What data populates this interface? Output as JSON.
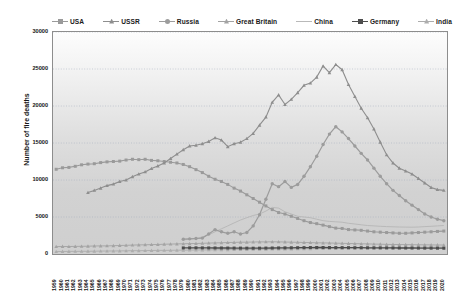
{
  "chart_data": {
    "type": "line",
    "title": "",
    "xlabel": "",
    "ylabel": "Number of fire deaths",
    "ylim": [
      0,
      30000
    ],
    "ytick_labels": [
      "0",
      "5000",
      "10000",
      "15000",
      "20000",
      "25000",
      "30000"
    ],
    "ytick_values": [
      0,
      5000,
      10000,
      15000,
      20000,
      25000,
      30000
    ],
    "grid": true,
    "legend_position": "top",
    "x": [
      1959,
      1960,
      1961,
      1962,
      1963,
      1964,
      1965,
      1966,
      1967,
      1968,
      1969,
      1970,
      1971,
      1972,
      1973,
      1974,
      1975,
      1976,
      1977,
      1978,
      1979,
      1980,
      1981,
      1982,
      1983,
      1984,
      1985,
      1986,
      1987,
      1988,
      1989,
      1990,
      1991,
      1992,
      1993,
      1994,
      1995,
      1996,
      1997,
      1998,
      1999,
      2000,
      2001,
      2002,
      2003,
      2004,
      2005,
      2006,
      2007,
      2008,
      2009,
      2010,
      2011,
      2012,
      2013,
      2014,
      2015,
      2016,
      2017,
      2018,
      2019,
      2020
    ],
    "series": [
      {
        "name": "USA",
        "color": "#9a9a9a",
        "marker": "square",
        "values": [
          11450,
          11650,
          11700,
          11850,
          12050,
          12150,
          12200,
          12350,
          12450,
          12500,
          12550,
          12700,
          12800,
          12750,
          12800,
          12650,
          12600,
          12500,
          12400,
          12300,
          12100,
          11800,
          11400,
          11000,
          10500,
          10100,
          9800,
          9400,
          8900,
          8500,
          8000,
          7500,
          7000,
          6500,
          6000,
          5600,
          5400,
          5100,
          4800,
          4500,
          4250,
          4100,
          3900,
          3700,
          3500,
          3450,
          3300,
          3250,
          3200,
          3100,
          3000,
          2950,
          2900,
          2850,
          2800,
          2800,
          2850,
          2900,
          2950,
          3000,
          3050,
          3100
        ]
      },
      {
        "name": "USSR",
        "color": "#8e8e8e",
        "marker": "triangle",
        "values": [
          null,
          null,
          null,
          null,
          null,
          8300,
          8600,
          8900,
          9250,
          9450,
          9800,
          10000,
          10450,
          10800,
          11100,
          11550,
          11900,
          12300,
          12900,
          13500,
          14100,
          14600,
          14700,
          14900,
          15200,
          15700,
          15400,
          14500,
          14900,
          15100,
          15600,
          16300,
          17400,
          18500,
          20500,
          21500,
          20200,
          20900,
          21800,
          22800,
          23100,
          23900,
          25400,
          24500,
          25600,
          24900,
          22900,
          21300,
          19700,
          18400,
          16900,
          15100,
          13400,
          12300,
          11600,
          11200,
          10800,
          10200,
          9600,
          9000,
          8700,
          8600
        ]
      },
      {
        "name": "Russia",
        "color": "#9c9c9c",
        "marker": "circle",
        "values": [
          null,
          null,
          null,
          null,
          null,
          null,
          null,
          null,
          null,
          null,
          null,
          null,
          null,
          null,
          null,
          null,
          null,
          null,
          null,
          null,
          null,
          null,
          null,
          null,
          null,
          null,
          null,
          null,
          null,
          null,
          null,
          null,
          null,
          null,
          null,
          null,
          null,
          null,
          null,
          null,
          null,
          null,
          null,
          null,
          null,
          null,
          null,
          null,
          null,
          null,
          null,
          null,
          null,
          null,
          null,
          null,
          null,
          null,
          null,
          null,
          null,
          null
        ]
      },
      {
        "name": "Great Britain",
        "color": "#a3a3a3",
        "marker": "triangle",
        "values": [
          1000,
          1020,
          1010,
          1030,
          1040,
          1060,
          1080,
          1090,
          1100,
          1120,
          1150,
          1170,
          1200,
          1230,
          1250,
          1270,
          1290,
          1320,
          1340,
          1360,
          1380,
          1400,
          1420,
          1450,
          1470,
          1500,
          1520,
          1550,
          1570,
          1590,
          1600,
          1620,
          1630,
          1640,
          1650,
          1640,
          1620,
          1600,
          1580,
          1560,
          1540,
          1520,
          1500,
          1480,
          1460,
          1440,
          1420,
          1400,
          1380,
          1360,
          1340,
          1320,
          1300,
          1290,
          1280,
          1270,
          1260,
          1250,
          1240,
          1230,
          1220,
          1210
        ]
      },
      {
        "name": "China",
        "color": "#b9b9b9",
        "marker": "none",
        "values": [
          null,
          null,
          null,
          null,
          null,
          null,
          null,
          null,
          null,
          null,
          null,
          null,
          null,
          null,
          null,
          null,
          null,
          null,
          null,
          null,
          1900,
          2000,
          2100,
          2300,
          2600,
          3000,
          3400,
          3800,
          4200,
          4600,
          4900,
          5200,
          5400,
          5800,
          6300,
          6200,
          5700,
          5400,
          5100,
          5000,
          4900,
          4700,
          4500,
          4400,
          4350,
          4300,
          4150,
          4050,
          3950,
          3850,
          3800,
          3750,
          3700,
          3680,
          3650,
          3630,
          3620,
          3650,
          3700,
          3750,
          3800,
          3850
        ]
      },
      {
        "name": "Germany",
        "color": "#4d4d4d",
        "marker": "square",
        "values": [
          null,
          null,
          null,
          null,
          null,
          null,
          null,
          null,
          null,
          null,
          null,
          null,
          null,
          null,
          null,
          null,
          null,
          null,
          null,
          null,
          820,
          830,
          835,
          825,
          820,
          815,
          810,
          805,
          800,
          795,
          790,
          785,
          790,
          800,
          810,
          820,
          830,
          840,
          850,
          860,
          870,
          880,
          875,
          870,
          865,
          860,
          855,
          850,
          845,
          840,
          835,
          830,
          825,
          820,
          815,
          810,
          805,
          800,
          795,
          790,
          785,
          780
        ]
      },
      {
        "name": "India",
        "color": "#adadad",
        "marker": "triangle",
        "values": [
          330,
          340,
          350,
          355,
          360,
          370,
          380,
          390,
          400,
          410,
          420,
          430,
          440,
          450,
          460,
          470,
          480,
          490,
          500,
          510,
          520,
          530,
          540,
          550,
          560,
          570,
          580,
          590,
          600,
          610,
          620,
          630,
          640,
          650,
          660,
          670,
          680,
          690,
          700,
          710,
          720,
          730,
          740,
          750,
          760,
          770,
          780,
          790,
          800,
          810,
          820,
          830,
          840,
          850,
          860,
          870,
          880,
          890,
          900,
          910,
          920,
          930
        ]
      }
    ],
    "ussr_russia_combined": {
      "comment": "USSR series drawn 1964-2020 as the tall curve; Russia drawn as the second tall curve peaking ~2003",
      "russia_values": [
        null,
        null,
        null,
        null,
        null,
        null,
        null,
        null,
        null,
        null,
        null,
        null,
        null,
        null,
        null,
        null,
        null,
        null,
        null,
        null,
        2000,
        2050,
        2100,
        2150,
        2700,
        3300,
        3000,
        2800,
        3000,
        2700,
        2900,
        3800,
        5300,
        7400,
        9500,
        9100,
        9800,
        9000,
        9400,
        10500,
        11800,
        13200,
        14800,
        16200,
        17200,
        16500,
        15600,
        14600,
        13600,
        12700,
        11600,
        10500,
        9500,
        8600,
        7900,
        7200,
        6600,
        6000,
        5400,
        5000,
        4700,
        4500
      ]
    }
  },
  "legend": {
    "items": [
      {
        "label": "USA",
        "color": "#9a9a9a",
        "marker": "square"
      },
      {
        "label": "USSR",
        "color": "#8e8e8e",
        "marker": "triangle"
      },
      {
        "label": "Russia",
        "color": "#9c9c9c",
        "marker": "circle"
      },
      {
        "label": "Great Britain",
        "color": "#a3a3a3",
        "marker": "triangle"
      },
      {
        "label": "China",
        "color": "#b9b9b9",
        "marker": "none"
      },
      {
        "label": "Germany",
        "color": "#4d4d4d",
        "marker": "square"
      },
      {
        "label": "India",
        "color": "#adadad",
        "marker": "triangle"
      }
    ]
  },
  "axes": {
    "y_title": "Number of fire deaths",
    "y_ticks": [
      "30000",
      "25000",
      "20000",
      "15000",
      "10000",
      "5000",
      "0"
    ],
    "x_ticks": [
      "1959",
      "1960",
      "1961",
      "1962",
      "1963",
      "1964",
      "1965",
      "1966",
      "1967",
      "1968",
      "1969",
      "1970",
      "1971",
      "1972",
      "1973",
      "1974",
      "1975",
      "1976",
      "1977",
      "1978",
      "1979",
      "1980",
      "1981",
      "1982",
      "1983",
      "1984",
      "1985",
      "1986",
      "1987",
      "1988",
      "1989",
      "1990",
      "1991",
      "1992",
      "1993",
      "1994",
      "1995",
      "1996",
      "1997",
      "1998",
      "1999",
      "2000",
      "2001",
      "2002",
      "2003",
      "2004",
      "2005",
      "2006",
      "2007",
      "2008",
      "2009",
      "2010",
      "2011",
      "2012",
      "2013",
      "2014",
      "2015",
      "2016",
      "2017",
      "2018",
      "2019",
      "2020"
    ]
  }
}
